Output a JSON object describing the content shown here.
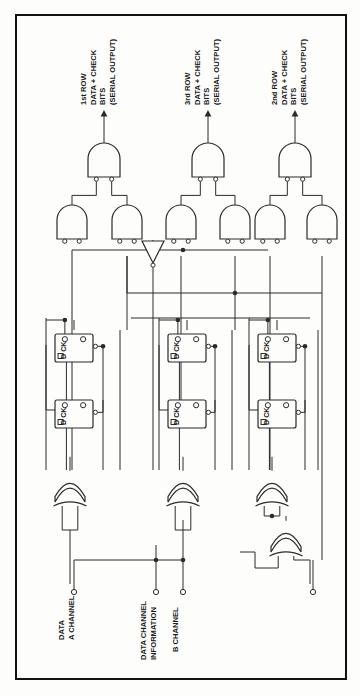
{
  "figure": {
    "type": "logic-circuit-schematic",
    "title": "",
    "frame": {
      "x": 16,
      "y": 15,
      "width": 330,
      "height": 664,
      "border_color": "#121212",
      "border_width": 2
    },
    "background_color": "#fdfdfc",
    "line_color": "#2b2b2b",
    "orientation": "rotated-90-text"
  },
  "output_labels": [
    {
      "id": "out-1",
      "lines": [
        "1st ROW",
        "DATA + CHECK",
        "BITS",
        "(SERIAL OUTPUT)"
      ],
      "x": 104,
      "y": 145
    },
    {
      "id": "out-3",
      "lines": [
        "3rd ROW",
        "DATA + CHECK",
        "BITS",
        "(SERIAL OUTPUT)"
      ],
      "x": 208,
      "y": 145
    },
    {
      "id": "out-2",
      "lines": [
        "2nd ROW",
        "DATA + CHECK",
        "BITS",
        "(SERIAL OUTPUT)"
      ],
      "x": 295,
      "y": 145
    }
  ],
  "input_labels": [
    {
      "id": "in-a",
      "lines": [
        "A CHANNEL",
        "DATA"
      ],
      "terminal_x": 74,
      "terminal_y": 590
    },
    {
      "id": "in-info",
      "lines": [
        "INFORMATION",
        "DATA CHANNEL"
      ],
      "terminal_x": 156,
      "terminal_y": 590
    },
    {
      "id": "in-b",
      "lines": [
        "B CHANNEL"
      ],
      "terminal_x": 183,
      "terminal_y": 590
    },
    {
      "id": "in-unlabeled",
      "lines": [],
      "terminal_x": 313,
      "terminal_y": 590
    }
  ],
  "gates": {
    "output_nand": [
      {
        "id": "nand-out-1",
        "cx": 104,
        "cy": 160
      },
      {
        "id": "nand-out-3",
        "cx": 208,
        "cy": 160
      },
      {
        "id": "nand-out-2",
        "cx": 295,
        "cy": 160
      }
    ],
    "pair_nand": [
      {
        "id": "nand-1a",
        "cx": 72,
        "cy": 222
      },
      {
        "id": "nand-1b",
        "cx": 127,
        "cy": 222
      },
      {
        "id": "nand-3a",
        "cx": 181,
        "cy": 222
      },
      {
        "id": "nand-3b",
        "cx": 235,
        "cy": 222
      },
      {
        "id": "nand-2a",
        "cx": 270,
        "cy": 222
      },
      {
        "id": "nand-2b",
        "cx": 322,
        "cy": 222
      }
    ],
    "inverter": [
      {
        "id": "inv-1",
        "cx": 153,
        "cy": 252
      }
    ],
    "xor": [
      {
        "id": "xor-1",
        "cx": 70,
        "cy": 487
      },
      {
        "id": "xor-3",
        "cx": 183,
        "cy": 487
      },
      {
        "id": "xor-2",
        "cx": 272,
        "cy": 487
      },
      {
        "id": "xor-sum",
        "cx": 286,
        "cy": 537
      }
    ]
  },
  "flipflops": [
    {
      "id": "ff-1-top",
      "label_d": "D",
      "label_ck": "CK",
      "x": 55,
      "y": 334,
      "w": 38,
      "h": 28
    },
    {
      "id": "ff-1-bot",
      "label_d": "D",
      "label_ck": "CK",
      "x": 55,
      "y": 400,
      "w": 38,
      "h": 28
    },
    {
      "id": "ff-3-top",
      "label_d": "D",
      "label_ck": "CK",
      "x": 168,
      "y": 334,
      "w": 38,
      "h": 28
    },
    {
      "id": "ff-3-bot",
      "label_d": "D",
      "label_ck": "CK",
      "x": 168,
      "y": 400,
      "w": 38,
      "h": 28
    },
    {
      "id": "ff-2-top",
      "label_d": "D",
      "label_ck": "CK",
      "x": 258,
      "y": 334,
      "w": 38,
      "h": 28
    },
    {
      "id": "ff-2-bot",
      "label_d": "D",
      "label_ck": "CK",
      "x": 258,
      "y": 400,
      "w": 38,
      "h": 28
    }
  ],
  "legend": {
    "nand_symbol": "nand-gate",
    "xor_symbol": "xor-gate",
    "inverter_symbol": "inverter-gate",
    "flipflop_symbol": "d-flip-flop",
    "terminal_symbol": "open-circle-terminal",
    "junction_symbol": "solid-dot-junction"
  }
}
